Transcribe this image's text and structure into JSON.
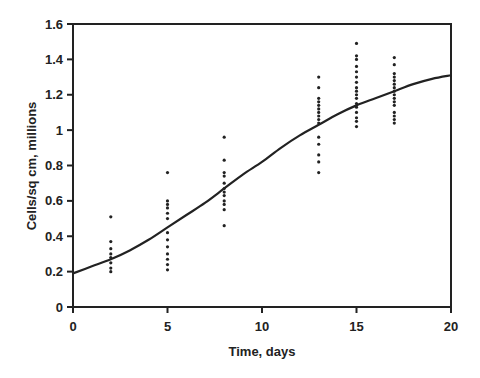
{
  "chart_data": {
    "type": "scatter",
    "title": "",
    "xlabel": "Time, days",
    "ylabel": "Cells/sq cm, millions",
    "xlim": [
      0,
      20
    ],
    "ylim": [
      0,
      1.6
    ],
    "x_ticks": [
      "0",
      "5",
      "10",
      "15",
      "20"
    ],
    "y_ticks": [
      "0",
      "0.2",
      "0.4",
      "0.6",
      "0.8",
      "1",
      "1.2",
      "1.4",
      "1.6"
    ],
    "grid": false,
    "legend": "none",
    "series": [
      {
        "name": "Observed",
        "style": "points",
        "groups": [
          {
            "x": 2,
            "values": [
              0.51,
              0.37,
              0.33,
              0.3,
              0.28,
              0.25,
              0.22,
              0.2
            ]
          },
          {
            "x": 5,
            "values": [
              0.76,
              0.6,
              0.58,
              0.56,
              0.53,
              0.5,
              0.42,
              0.38,
              0.34,
              0.3,
              0.27,
              0.24,
              0.21
            ]
          },
          {
            "x": 8,
            "values": [
              0.96,
              0.83,
              0.76,
              0.74,
              0.7,
              0.67,
              0.65,
              0.63,
              0.6,
              0.58,
              0.55,
              0.46
            ]
          },
          {
            "x": 13,
            "values": [
              1.3,
              1.24,
              1.18,
              1.16,
              1.14,
              1.12,
              1.1,
              1.08,
              1.06,
              1.04,
              0.96,
              0.92,
              0.86,
              0.82,
              0.76
            ]
          },
          {
            "x": 15,
            "values": [
              1.49,
              1.42,
              1.4,
              1.36,
              1.33,
              1.3,
              1.27,
              1.24,
              1.22,
              1.2,
              1.18,
              1.15,
              1.13,
              1.1,
              1.07,
              1.05,
              1.02
            ]
          },
          {
            "x": 17,
            "values": [
              1.41,
              1.37,
              1.32,
              1.3,
              1.28,
              1.26,
              1.24,
              1.22,
              1.2,
              1.18,
              1.16,
              1.14,
              1.1,
              1.08,
              1.06,
              1.04
            ]
          }
        ]
      },
      {
        "name": "Fitted curve",
        "style": "line",
        "x": [
          0,
          1,
          2,
          3,
          4,
          5,
          6,
          7,
          8,
          9,
          10,
          11,
          12,
          13,
          14,
          15,
          16,
          17,
          18,
          19,
          20
        ],
        "values": [
          0.19,
          0.23,
          0.27,
          0.32,
          0.38,
          0.45,
          0.52,
          0.59,
          0.67,
          0.75,
          0.82,
          0.9,
          0.97,
          1.03,
          1.09,
          1.14,
          1.18,
          1.22,
          1.26,
          1.29,
          1.31
        ]
      }
    ],
    "colors": {
      "points": "#222222",
      "line": "#222222",
      "axis": "#222222"
    }
  }
}
